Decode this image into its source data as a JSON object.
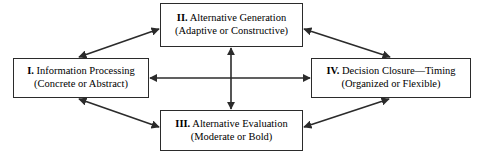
{
  "diagram": {
    "type": "cyclical-four-stage-model",
    "nodes": [
      {
        "id": "information-processing",
        "numeral": "I.",
        "title": " Information Processing",
        "subtitle": "(Concrete or Abstract)",
        "position": "left"
      },
      {
        "id": "alternative-generation",
        "numeral": "II.",
        "title": " Alternative Generation",
        "subtitle": "(Adaptive or Constructive)",
        "position": "top"
      },
      {
        "id": "alternative-evaluation",
        "numeral": "III.",
        "title": " Alternative Evaluation",
        "subtitle": "(Moderate or Bold)",
        "position": "bottom"
      },
      {
        "id": "decision-closure-timing",
        "numeral": "IV.",
        "title": " Decision Closure—Timing",
        "subtitle": "(Organized or Flexible)",
        "position": "right"
      }
    ],
    "connectors": [
      {
        "id": "left-to-top",
        "from": "information-processing",
        "to": "alternative-generation",
        "style": "double-headed-diagonal"
      },
      {
        "id": "top-to-right",
        "from": "alternative-generation",
        "to": "decision-closure-timing",
        "style": "double-headed-diagonal"
      },
      {
        "id": "left-to-bottom",
        "from": "information-processing",
        "to": "alternative-evaluation",
        "style": "double-headed-diagonal"
      },
      {
        "id": "bottom-to-right",
        "from": "alternative-evaluation",
        "to": "decision-closure-timing",
        "style": "double-headed-diagonal"
      },
      {
        "id": "left-to-right",
        "from": "information-processing",
        "to": "decision-closure-timing",
        "style": "double-headed-horizontal"
      },
      {
        "id": "top-to-bottom",
        "from": "alternative-generation",
        "to": "alternative-evaluation",
        "style": "double-headed-vertical"
      }
    ],
    "colors": {
      "line": "#2b2b2b",
      "box_border": "#2b2b2b",
      "box_fill": "#ffffff",
      "text": "#000000",
      "background": "#ffffff"
    }
  }
}
